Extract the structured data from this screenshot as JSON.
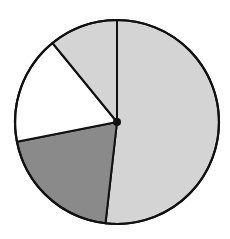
{
  "chart_data": {
    "type": "pie",
    "title": "",
    "start_angle_deg": 0,
    "direction": "clockwise",
    "legend": null,
    "labels": [],
    "slices": [
      {
        "name": "slice-1",
        "value": 51.8,
        "color": "#d4d4d4"
      },
      {
        "name": "slice-2",
        "value": 20.1,
        "color": "#8a8a8a"
      },
      {
        "name": "slice-3",
        "value": 17.2,
        "color": "#ffffff"
      },
      {
        "name": "slice-4",
        "value": 10.9,
        "color": "#d4d4d4"
      }
    ],
    "center": [
      117,
      122
    ],
    "radius": 102,
    "stroke_color": "#111111",
    "center_dot": true
  }
}
